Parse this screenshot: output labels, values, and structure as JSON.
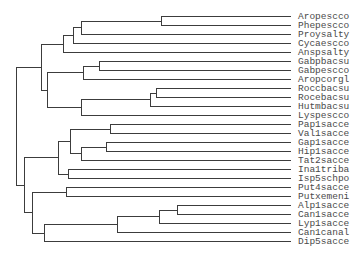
{
  "diagram": {
    "type": "dendrogram",
    "orientation": "root-left, leaves-right",
    "colors": {
      "line": "#3c3c3c",
      "text": "#4a4a4a",
      "background": "#ffffff"
    },
    "layout": {
      "leaf_x": 291,
      "label_x": 298,
      "leaf_y_start": 16,
      "leaf_spacing": 9
    },
    "leaves": [
      {
        "label": "Aropescco"
      },
      {
        "label": "Phepescco"
      },
      {
        "label": "Proysalty"
      },
      {
        "label": "Cycaescco"
      },
      {
        "label": "Anspsalty"
      },
      {
        "label": "Gabpbacsu"
      },
      {
        "label": "Gabpescco"
      },
      {
        "label": "Aropcorgl"
      },
      {
        "label": "Roccbacsu"
      },
      {
        "label": "Rocebacsu"
      },
      {
        "label": "Hutmbacsu"
      },
      {
        "label": "Lyspescco"
      },
      {
        "label": "Pap1sacce"
      },
      {
        "label": "Val1sacce"
      },
      {
        "label": "Gap1sacce"
      },
      {
        "label": "Hip1sacce"
      },
      {
        "label": "Tat2sacce"
      },
      {
        "label": "Ina1triba"
      },
      {
        "label": "Isp5schpo"
      },
      {
        "label": "Put4sacce"
      },
      {
        "label": "Putxemeni"
      },
      {
        "label": "Alp1sacce"
      },
      {
        "label": "Can1sacce"
      },
      {
        "label": "Lyp1sacce"
      },
      {
        "label": "Can1canal"
      },
      {
        "label": "Dip5sacce"
      }
    ],
    "tree": {
      "x": 16,
      "children": [
        {
          "x": 41,
          "children": [
            {
              "x": 63,
              "children": [
                {
                  "x": 73,
                  "children": [
                    {
                      "x": 81,
                      "children": [
                        {
                          "x": 161,
                          "children": [
                            0,
                            1
                          ]
                        },
                        2
                      ]
                    },
                    3
                  ]
                },
                4
              ]
            },
            {
              "x": 47,
              "children": [
                {
                  "x": 83,
                  "children": [
                    {
                      "x": 99,
                      "children": [
                        5,
                        6
                      ]
                    },
                    7
                  ]
                },
                {
                  "x": 81,
                  "children": [
                    {
                      "x": 150,
                      "children": [
                        {
                          "x": 156,
                          "children": [
                            8,
                            9
                          ]
                        },
                        10
                      ]
                    },
                    11
                  ]
                }
              ]
            }
          ]
        },
        {
          "x": 24,
          "children": [
            {
              "x": 58,
              "children": [
                {
                  "x": 70,
                  "children": [
                    {
                      "x": 110,
                      "children": [
                        12,
                        13
                      ]
                    },
                    {
                      "x": 81,
                      "children": [
                        {
                          "x": 106,
                          "children": [
                            14,
                            15
                          ]
                        },
                        16
                      ]
                    }
                  ]
                },
                {
                  "x": 68,
                  "children": [
                    17,
                    18
                  ]
                }
              ]
            },
            {
              "x": 32,
              "children": [
                {
                  "x": 66,
                  "children": [
                    19,
                    20
                  ]
                },
                {
                  "x": 44,
                  "children": [
                    {
                      "x": 117,
                      "children": [
                        {
                          "x": 159,
                          "children": [
                            {
                              "x": 177,
                              "children": [
                                21,
                                22
                              ]
                            },
                            23
                          ]
                        },
                        24
                      ]
                    },
                    25
                  ]
                }
              ]
            }
          ]
        }
      ]
    }
  }
}
